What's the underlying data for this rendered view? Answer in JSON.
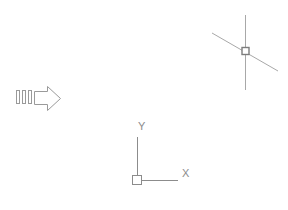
{
  "app": {
    "canvas_name": "drawing-viewport",
    "background_color": "#ffffff"
  },
  "cursor": {
    "name": "crosshair-cursor",
    "pickbox_label": "",
    "color": "#9a9a9a",
    "pickbox_color": "#808080",
    "position": {
      "x": 245,
      "y": 51
    },
    "vertical_line": {
      "x": 245,
      "y1": 15,
      "y2": 90
    },
    "diagonal_line": {
      "x1": 212,
      "y1": 33,
      "x2": 278,
      "y2": 71
    },
    "pickbox_size": 7
  },
  "ucs_icon": {
    "name": "ucs-coordinate-icon",
    "color": "#8c8c8c",
    "origin": {
      "x": 137,
      "y": 180
    },
    "x_axis_label": "X",
    "y_axis_label": "Y",
    "x_axis_end": {
      "x": 178,
      "y": 180
    },
    "y_axis_end": {
      "x": 137,
      "y": 137
    },
    "origin_box_size": 9
  },
  "arrow_graphic": {
    "name": "right-arrow-graphic",
    "color": "#9a9a9a",
    "bounds": {
      "x": 16,
      "y": 86,
      "width": 45,
      "height": 25
    },
    "motion_lines_count": 3,
    "direction": "right"
  }
}
